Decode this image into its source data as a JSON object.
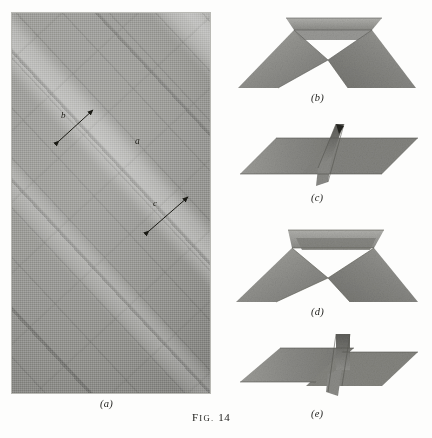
{
  "figure": {
    "caption_prefix": "F",
    "caption_smallcaps": "IG.",
    "caption_number": "14",
    "caption_full": "FIG. 14"
  },
  "panels": [
    {
      "id": "a",
      "label": "(a)",
      "kind": "photograph",
      "description": "halftone photomicrograph of a striated crystal surface",
      "annotations": [
        {
          "label": "b",
          "kind": "dimension-arrow"
        },
        {
          "label": "a",
          "kind": "point-marker"
        },
        {
          "label": "c",
          "kind": "dimension-arrow"
        }
      ]
    },
    {
      "id": "b",
      "label": "(b)",
      "kind": "folded-paper-model",
      "description": "two sheets folded into an inverted V with a flat top flange"
    },
    {
      "id": "c",
      "label": "(c)",
      "kind": "folded-paper-model",
      "description": "flattened parallelogram sheets with a raised central fold"
    },
    {
      "id": "d",
      "label": "(d)",
      "kind": "folded-paper-model",
      "description": "inverted V model viewed with a deeper top flange"
    },
    {
      "id": "e",
      "label": "(e)",
      "kind": "folded-paper-model",
      "description": "flattened parallelogram sheets with a vertical central fin"
    }
  ],
  "colors": {
    "page_background": "#fdfdfc",
    "photo_mid_grey": "#9b9b97",
    "paper_grey": "#8e8e8a",
    "paper_grey_dark": "#6f6f6b",
    "paper_grey_light": "#a8a8a4",
    "ink": "#1d1d1a"
  }
}
